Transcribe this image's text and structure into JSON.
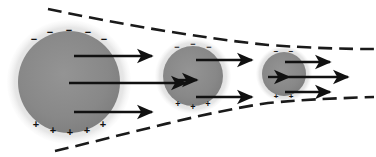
{
  "figure": {
    "background_color": "#ffffff",
    "width": 376,
    "height": 157,
    "core_color": "#8a8a8a",
    "halo_color": "#d8d8d8",
    "arrow_color": "#111111",
    "boundary_color": "#1a1a1a",
    "charge_color": "#111111"
  },
  "spheres": [
    {
      "id": "sphere-large",
      "cx": 69,
      "cy": 82,
      "core_r": 51,
      "halo_r": 62,
      "negative_signs": [
        "−",
        "−",
        "−",
        "−",
        "−"
      ],
      "positive_signs": [
        "+",
        "+",
        "+",
        "+",
        "+"
      ],
      "negative_count": 5,
      "positive_count": 5
    },
    {
      "id": "sphere-medium",
      "cx": 193,
      "cy": 76,
      "core_r": 30,
      "halo_r": 38,
      "negative_signs": [
        "−",
        "−",
        "−"
      ],
      "positive_signs": [
        "+",
        "+",
        "+"
      ],
      "negative_count": 3,
      "positive_count": 3
    },
    {
      "id": "sphere-small",
      "cx": 284,
      "cy": 74,
      "core_r": 22,
      "halo_r": 28,
      "negative_signs": [
        "−",
        "−"
      ],
      "positive_signs": [
        "+",
        "+"
      ],
      "negative_count": 2,
      "positive_count": 2
    }
  ],
  "arrows": [
    {
      "id": "arrow-1-top",
      "x1": 74,
      "y1": 56,
      "x2": 152,
      "y2": 56
    },
    {
      "id": "arrow-1-middle",
      "x1": 69,
      "y1": 83,
      "x2": 186,
      "y2": 83
    },
    {
      "id": "arrow-1-bottom",
      "x1": 74,
      "y1": 112,
      "x2": 152,
      "y2": 112
    },
    {
      "id": "arrow-2-top",
      "x1": 196,
      "y1": 60,
      "x2": 252,
      "y2": 60
    },
    {
      "id": "arrow-2-middle",
      "x1": 176,
      "y1": 80,
      "x2": 196,
      "y2": 80
    },
    {
      "id": "arrow-2-bottom",
      "x1": 196,
      "y1": 97,
      "x2": 252,
      "y2": 97
    },
    {
      "id": "arrow-3-top",
      "x1": 285,
      "y1": 62,
      "x2": 330,
      "y2": 62
    },
    {
      "id": "arrow-3-middle",
      "x1": 268,
      "y1": 77,
      "x2": 288,
      "y2": 77
    },
    {
      "id": "arrow-3-long",
      "x1": 288,
      "y1": 77,
      "x2": 348,
      "y2": 77
    },
    {
      "id": "arrow-3-bottom",
      "x1": 285,
      "y1": 92,
      "x2": 330,
      "y2": 92
    }
  ],
  "boundaries": [
    {
      "id": "boundary-upper",
      "path": "M 48 9 C 120 24, 200 38, 268 45 C 310 48, 345 49, 374 49",
      "dash": "14 7"
    },
    {
      "id": "boundary-lower",
      "path": "M 55 151 C 120 136, 200 113, 268 103 C 310 99, 345 98, 374 97",
      "dash": "14 7"
    }
  ]
}
